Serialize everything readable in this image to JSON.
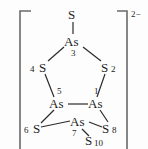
{
  "figure": {
    "kind": "chemical-structure-diagram",
    "charge": "2−",
    "bracket_left": "[",
    "bracket_right": "]"
  },
  "atoms": [
    {
      "id": "s-top",
      "element": "S",
      "index": "",
      "x": 73,
      "y": 14
    },
    {
      "id": "as-3",
      "element": "As",
      "index": "3",
      "x": 73,
      "y": 42
    },
    {
      "id": "s-4",
      "element": "S",
      "index": "4",
      "x": 43,
      "y": 68
    },
    {
      "id": "s-2",
      "element": "S",
      "index": "2",
      "x": 106,
      "y": 68
    },
    {
      "id": "as-5",
      "element": "As",
      "index": "5",
      "x": 58,
      "y": 104
    },
    {
      "id": "as-1",
      "element": "As",
      "index": "1",
      "x": 97,
      "y": 104
    },
    {
      "id": "s-6",
      "element": "S",
      "index": "6",
      "x": 34,
      "y": 128
    },
    {
      "id": "as-7",
      "element": "As",
      "index": "7",
      "x": 79,
      "y": 123
    },
    {
      "id": "s-8",
      "element": "S",
      "index": "8",
      "x": 107,
      "y": 128
    },
    {
      "id": "s-10",
      "element": "S",
      "index": "10",
      "x": 92,
      "y": 141
    }
  ],
  "bonds": [
    {
      "from": "s-top",
      "to": "as-3"
    },
    {
      "from": "as-3",
      "to": "s-4"
    },
    {
      "from": "as-3",
      "to": "s-2"
    },
    {
      "from": "s-4",
      "to": "as-5"
    },
    {
      "from": "s-2",
      "to": "as-1"
    },
    {
      "from": "as-5",
      "to": "as-1"
    },
    {
      "from": "as-5",
      "to": "s-6"
    },
    {
      "from": "as-1",
      "to": "s-8"
    },
    {
      "from": "s-6",
      "to": "as-7"
    },
    {
      "from": "as-7",
      "to": "s-8"
    },
    {
      "from": "as-7",
      "to": "s-10"
    }
  ],
  "colors": {
    "bond": "#2b2b2b",
    "text": "#1c1c1c",
    "bracket": "#6a6a6a",
    "background": "#fdfdfd"
  }
}
